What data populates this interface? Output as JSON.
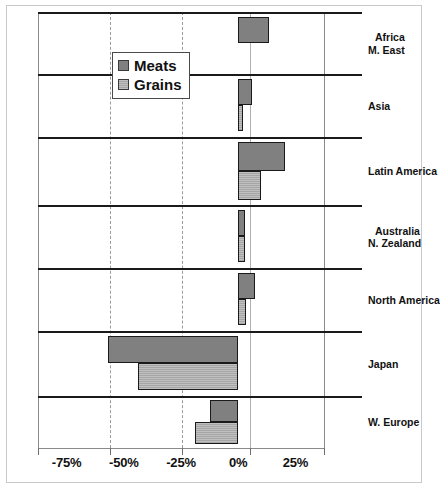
{
  "chart_data": {
    "type": "bar",
    "orientation": "horizontal",
    "title": "",
    "xlabel": "",
    "ylabel": "",
    "xlim": [
      -87.5,
      37.5
    ],
    "xticks": [
      -75,
      -50,
      -25,
      0,
      25
    ],
    "xtick_labels": [
      "-75%",
      "-50%",
      "-25%",
      "0%",
      "25%"
    ],
    "grid": true,
    "grid_axis": "x",
    "legend_position": "upper-left-inside",
    "categories": [
      "Africa M. East",
      "Asia",
      "Latin America",
      "Australia N. Zealand",
      "North America",
      "Japan",
      "W. Europe"
    ],
    "category_labels": [
      {
        "line1": "Africa",
        "line2": "M. East",
        "indent": true
      },
      {
        "line1": "Asia",
        "line2": "",
        "indent": false
      },
      {
        "line1": "Latin America",
        "line2": "",
        "indent": false
      },
      {
        "line1": "Australia",
        "line2": "N. Zealand",
        "indent": true
      },
      {
        "line1": "North America",
        "line2": "",
        "indent": false
      },
      {
        "line1": "Japan",
        "line2": "",
        "indent": false
      },
      {
        "line1": "W. Europe",
        "line2": "",
        "indent": false
      }
    ],
    "series": [
      {
        "name": "Meats",
        "color": "#808080",
        "values": [
          13.5,
          6.0,
          20.5,
          3.0,
          7.5,
          -57.0,
          -12.5
        ]
      },
      {
        "name": "Grains",
        "color": "#a5a5a5",
        "values": [
          0.0,
          2.0,
          10.0,
          3.0,
          3.5,
          -44.0,
          -19.0
        ]
      }
    ]
  },
  "legend": {
    "items": [
      {
        "label": "Meats",
        "swatch": "meats"
      },
      {
        "label": "Grains",
        "swatch": "grains"
      }
    ]
  },
  "axis": {
    "tick_labels": [
      "-75%",
      "-50%",
      "-25%",
      "0%",
      "25%"
    ]
  }
}
